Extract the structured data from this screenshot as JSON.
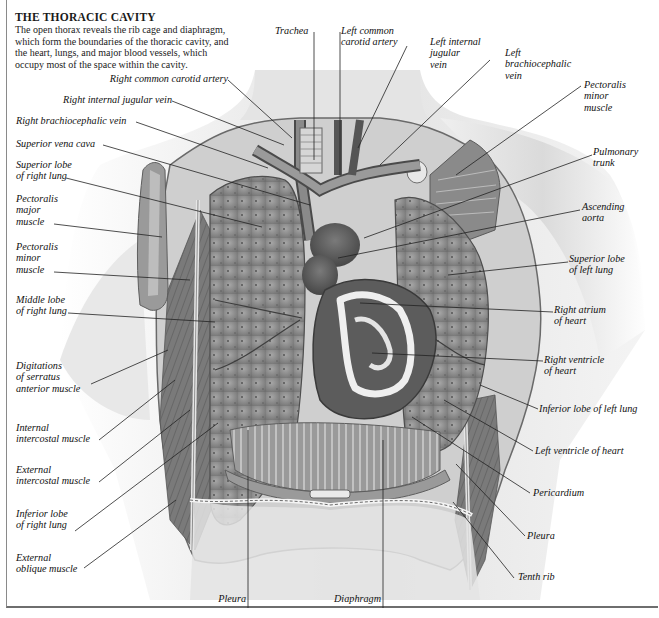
{
  "figure": {
    "title": "THE THORACIC CAVITY",
    "caption_lines": [
      "The open thorax reveals the rib cage and diaphragm,",
      "which form the boundaries of the thoracic cavity, and",
      "the heart, lungs, and major blood vessels, which",
      "occupy most of the space within the cavity."
    ]
  },
  "labels": {
    "top": [
      {
        "id": "trachea",
        "lines": [
          "Trachea"
        ]
      },
      {
        "id": "left-common-carotid-artery",
        "lines": [
          "Left common",
          "carotid artery"
        ]
      },
      {
        "id": "left-internal-jugular-vein",
        "lines": [
          "Left internal",
          "jugular",
          "vein"
        ]
      },
      {
        "id": "left-brachiocephalic-vein",
        "lines": [
          "Left",
          "brachiocephalic",
          "vein"
        ]
      }
    ],
    "left": [
      {
        "id": "right-common-carotid-artery",
        "lines": [
          "Right common carotid artery"
        ]
      },
      {
        "id": "right-internal-jugular-vein",
        "lines": [
          "Right internal jugular vein"
        ]
      },
      {
        "id": "right-brachiocephalic-vein",
        "lines": [
          "Right brachiocephalic vein"
        ]
      },
      {
        "id": "superior-vena-cava",
        "lines": [
          "Superior vena cava"
        ]
      },
      {
        "id": "superior-lobe-right-lung",
        "lines": [
          "Superior lobe",
          "of right lung"
        ]
      },
      {
        "id": "pectoralis-major-muscle",
        "lines": [
          "Pectoralis",
          "major",
          "muscle"
        ]
      },
      {
        "id": "pectoralis-minor-muscle-left",
        "lines": [
          "Pectoralis",
          "minor",
          "muscle"
        ]
      },
      {
        "id": "middle-lobe-right-lung",
        "lines": [
          "Middle lobe",
          "of right lung"
        ]
      },
      {
        "id": "digitations-serratus",
        "lines": [
          "Digitations",
          "of serratus",
          "anterior muscle"
        ]
      },
      {
        "id": "internal-intercostal-muscle",
        "lines": [
          "Internal",
          "intercostal muscle"
        ]
      },
      {
        "id": "external-intercostal-muscle",
        "lines": [
          "External",
          "intercostal muscle"
        ]
      },
      {
        "id": "inferior-lobe-right-lung",
        "lines": [
          "Inferior lobe",
          "of right lung"
        ]
      },
      {
        "id": "external-oblique-muscle",
        "lines": [
          "External",
          "oblique muscle"
        ]
      }
    ],
    "right": [
      {
        "id": "pectoralis-minor-muscle-right",
        "lines": [
          "Pectoralis",
          "minor",
          "muscle"
        ]
      },
      {
        "id": "pulmonary-trunk",
        "lines": [
          "Pulmonary",
          "trunk"
        ]
      },
      {
        "id": "ascending-aorta",
        "lines": [
          "Ascending",
          "aorta"
        ]
      },
      {
        "id": "superior-lobe-left-lung",
        "lines": [
          "Superior lobe",
          "of left lung"
        ]
      },
      {
        "id": "right-atrium-of-heart",
        "lines": [
          "Right atrium",
          "of heart"
        ]
      },
      {
        "id": "right-ventricle-of-heart",
        "lines": [
          "Right ventricle",
          "of heart"
        ]
      },
      {
        "id": "inferior-lobe-left-lung",
        "lines": [
          "Inferior lobe of left lung"
        ]
      },
      {
        "id": "left-ventricle-of-heart",
        "lines": [
          "Left ventricle of heart"
        ]
      },
      {
        "id": "pericardium",
        "lines": [
          "Pericardium"
        ]
      },
      {
        "id": "pleura-right",
        "lines": [
          "Pleura"
        ]
      },
      {
        "id": "tenth-rib",
        "lines": [
          "Tenth rib"
        ]
      }
    ],
    "bottom": [
      {
        "id": "pleura-bottom",
        "lines": [
          "Pleura"
        ]
      },
      {
        "id": "diaphragm",
        "lines": [
          "Diaphragm"
        ]
      }
    ]
  },
  "colors": {
    "ink": "#1a1a1a",
    "leader": "#222222",
    "skin_light": "#eeeeee",
    "skin_shade": "#cfcfcf",
    "lung": "#8c8c8c",
    "lung_dark": "#6f6f6f",
    "muscle": "#7d7d7d",
    "heart": "#5a5a5a",
    "fat": "#e6e6e6",
    "frame": "#6e6e6e"
  }
}
